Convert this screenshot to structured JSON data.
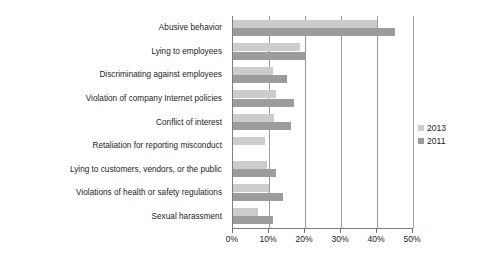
{
  "chart_data": {
    "type": "bar",
    "orientation": "horizontal",
    "title": "",
    "xlabel": "",
    "ylabel": "",
    "xlim": [
      0,
      50
    ],
    "xticks": [
      0,
      10,
      20,
      30,
      40,
      50
    ],
    "xtick_labels": [
      "0%",
      "10%",
      "20%",
      "30%",
      "40%",
      "50%"
    ],
    "grid": true,
    "legend_position": "right",
    "categories": [
      "Abusive behavior",
      "Lying to employees",
      "Discriminating against employees",
      "Violation of company Internet policies",
      "Conflict of interest",
      "Retaliation for reporting misconduct",
      "Lying to customers, vendors, or the public",
      "Violations of health or safety regulations",
      "Sexual harassment"
    ],
    "series": [
      {
        "name": "2013",
        "color": "#cccccc",
        "values": [
          40,
          18.5,
          11,
          12,
          11.5,
          9,
          9.5,
          10,
          7
        ]
      },
      {
        "name": "2011",
        "color": "#9c9c9c",
        "values": [
          45,
          20,
          15,
          17,
          16,
          0,
          12,
          14,
          11
        ]
      }
    ]
  },
  "legend": {
    "items": [
      {
        "label": "2013",
        "color": "#cccccc"
      },
      {
        "label": "2011",
        "color": "#9c9c9c"
      }
    ]
  },
  "axis": {
    "tick_labels": [
      "0%",
      "10%",
      "20%",
      "30%",
      "40%",
      "50%"
    ]
  },
  "colors": {
    "series_2013": "#cccccc",
    "series_2011": "#9c9c9c",
    "gridline": "#9b9b9b",
    "axis": "#7d7d7d",
    "text": "#1c1c1c",
    "background": "#ffffff"
  }
}
